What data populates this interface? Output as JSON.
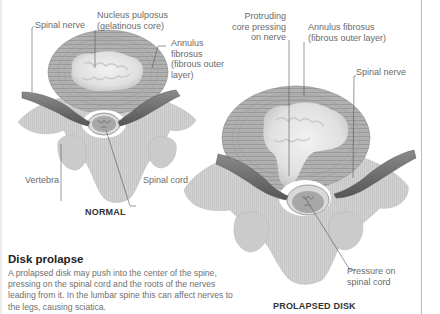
{
  "colors": {
    "annulus": "#a9a9a9",
    "annulus_stripe": "#8e8e8e",
    "nucleus": "#e6e6e6",
    "nucleus_shadow": "#bdbdbd",
    "bone": "#cfcfcf",
    "bone_shadow": "#b3b3b3",
    "nerve": "#6e6e6e",
    "nerve_dark": "#4d4d4d",
    "cord": "#999999",
    "leader": "#555555",
    "label_text": "#6a6a6a",
    "border": "#bdbdbd"
  },
  "normal": {
    "caption": "NORMAL",
    "labels": {
      "spinal_nerve": "Spinal nerve",
      "nucleus_pulposus": "Nucleus pulposus\n(gelatinous core)",
      "annulus_fibrosus": "Annulus\nfibrosus\n(fibrous outer\nlayer)",
      "vertebra": "Vertebra",
      "spinal_cord": "Spinal cord"
    }
  },
  "prolapsed": {
    "caption": "PROLAPSED DISK",
    "labels": {
      "protruding_core": "Protruding\ncore pressing\non nerve",
      "annulus_fibrosus": "Annulus fibrosus\n(fibrous outer layer)",
      "spinal_nerve": "Spinal nerve",
      "pressure": "Pressure on\nspinal cord"
    }
  },
  "text": {
    "heading": "Disk prolapse",
    "body": "A prolapsed disk may push into the center of the spine, pressing on the spinal cord and the roots of the nerves leading from it. In the lumbar spine this can affect nerves to the legs, causing sciatica."
  }
}
